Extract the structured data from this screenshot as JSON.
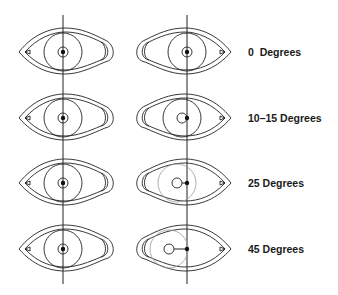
{
  "diagram": {
    "rows": [
      {
        "label": "0  Degrees",
        "degrees": "0",
        "pupil_offset": 0
      },
      {
        "label": "10–15 Degrees",
        "degrees": "10–15",
        "pupil_offset": 5
      },
      {
        "label": "25 Degrees",
        "degrees": "25",
        "pupil_offset": 10
      },
      {
        "label": "45 Degrees",
        "degrees": "45",
        "pupil_offset": 18
      }
    ],
    "colors": {
      "line": "#222222",
      "faint": "#999999",
      "background": "#ffffff"
    }
  }
}
